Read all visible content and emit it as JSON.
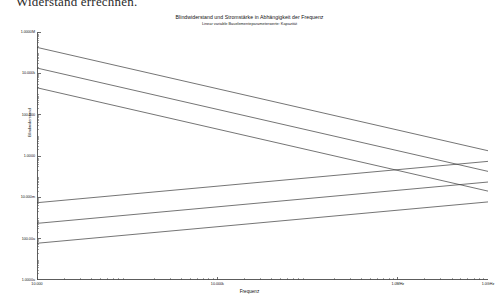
{
  "document": {
    "body_text_line": "Widerstand errechnen."
  },
  "chart_data": {
    "type": "line",
    "title": "Blindwiderstand und Stromstärke in Abhängigkeit der Frequenz",
    "subtitle": "Linear variable Bauelementeparameterwerte: Kapazität",
    "xlabel": "Frequenz",
    "ylabel": "Blindwiderstand",
    "xscale": "log",
    "yscale": "log",
    "grid": false,
    "legend": "none",
    "xlim": [
      10000,
      1000000000
    ],
    "ylim": [
      1e-06,
      1000000
    ],
    "xticks": [
      10000,
      1000000,
      100000000,
      1000000000
    ],
    "xtick_labels": [
      "10.000",
      "10.000k",
      "1.0MHz",
      "1.0GHz"
    ],
    "yticks": [
      1000000,
      10000,
      100,
      1,
      0.01,
      0.0001,
      1e-06
    ],
    "ytick_labels": [
      "1.0000M",
      "10.000k",
      "100.000",
      "1.0000",
      "10.000m",
      "100.00u",
      "1.0000u"
    ],
    "series": [
      {
        "name": "Blindwiderstand Xc (C klein)",
        "kind": "reactance",
        "slope": -1,
        "points": [
          [
            10000,
            180000
          ],
          [
            1000000000,
            1.8
          ]
        ]
      },
      {
        "name": "Blindwiderstand Xc (C mittel)",
        "kind": "reactance",
        "slope": -1,
        "points": [
          [
            10000,
            18000
          ],
          [
            1000000000,
            0.18
          ]
        ]
      },
      {
        "name": "Blindwiderstand Xc (C gross)",
        "kind": "reactance",
        "slope": -1,
        "points": [
          [
            10000,
            2000
          ],
          [
            1000000000,
            0.02
          ]
        ]
      },
      {
        "name": "Stromstärke I (C gross)",
        "kind": "current",
        "slope": 1,
        "points": [
          [
            10000,
            0.0055
          ],
          [
            1000000000,
            0.55
          ]
        ]
      },
      {
        "name": "Stromstärke I (C mittel)",
        "kind": "current",
        "slope": 1,
        "points": [
          [
            10000,
            0.00055
          ],
          [
            1000000000,
            0.055
          ]
        ]
      },
      {
        "name": "Stromstärke I (C klein)",
        "kind": "current",
        "slope": 1,
        "points": [
          [
            10000,
            6e-05
          ],
          [
            1000000000,
            0.006
          ]
        ]
      }
    ],
    "line_color": "#3a3a3a",
    "axis_color": "#4a4a4a"
  }
}
